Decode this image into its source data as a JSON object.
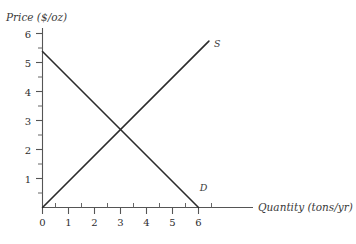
{
  "chart_data": {
    "type": "line",
    "title": "",
    "xlabel": "Quantity (tons/yr)",
    "ylabel": "Price ($/oz)",
    "xlim": [
      0,
      6.8
    ],
    "ylim": [
      0,
      6.3
    ],
    "xticks": [
      0,
      1,
      2,
      3,
      4,
      5,
      6
    ],
    "yticks": [
      1,
      2,
      3,
      4,
      5,
      6
    ],
    "xtick_labels": [
      "0",
      "1",
      "2",
      "3",
      "4",
      "5",
      "6"
    ],
    "ytick_labels": [
      "1",
      "2",
      "3",
      "4",
      "5",
      "6"
    ],
    "minor_tick_step": 0.5,
    "grid": false,
    "legend_position": "inline-curve-end",
    "line_color": "#2b2b2b",
    "axis_color": "#555555",
    "series": [
      {
        "name": "D",
        "label": "D",
        "description": "Demand curve",
        "x": [
          0,
          6
        ],
        "y": [
          6,
          0
        ],
        "label_x": 6.05,
        "label_y": 0.62
      },
      {
        "name": "S",
        "label": "S",
        "description": "Supply curve",
        "x": [
          0,
          6.4
        ],
        "y": [
          0,
          6.4
        ],
        "label_x": 6.6,
        "label_y": 6.18
      }
    ],
    "annotations": [
      {
        "name": "equilibrium",
        "x": 3,
        "y": 3,
        "text": ""
      }
    ]
  },
  "labels": {
    "y_axis_title": "Price ($/oz)",
    "x_axis_title": "Quantity (tons/yr)",
    "supply_label": "S",
    "demand_label": "D"
  },
  "y_tick_text": {
    "t6": "6",
    "t5": "5",
    "t4": "4",
    "t3": "3",
    "t2": "2",
    "t1": "1"
  },
  "x_tick_text": {
    "t0": "0",
    "t1": "1",
    "t2": "2",
    "t3": "3",
    "t4": "4",
    "t5": "5",
    "t6": "6"
  }
}
